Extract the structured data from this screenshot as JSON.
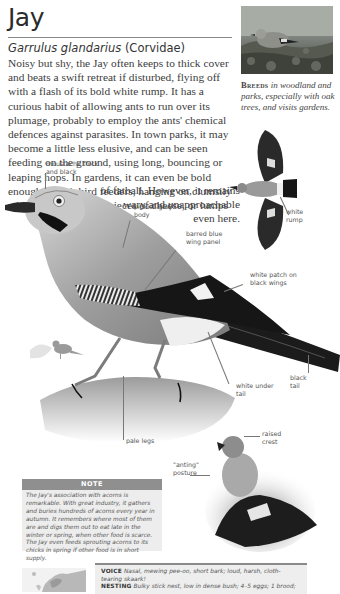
{
  "header": {
    "title": "Jay",
    "latin_name": "Garrulus glandarius",
    "family": "(Corvidae)"
  },
  "body": {
    "main_text": "Noisy but shy, the Jay often keeps to thick cover and beats a swift retreat if disturbed, flying off with a flash of its bold white rump. It has a curious habit of allowing ants to run over its plumage, probably to employ the ants' chemical defences against parasites. In town parks, it may become a little less elusive, and can be seen feeding on the ground, using long, bouncing or leaping hops. In gardens, it can even be bold enough to visit bird feeders, hanging on clumsily while taking peanuts, pieces of cheese, or lumps",
    "tail_text": "of fatball. However, it remains wary and unapproachable even here."
  },
  "photo": {
    "breeds_label": "Breeds",
    "breeds_text": "in woodland and parks, especially with oak trees, and visits gardens."
  },
  "annotations": {
    "moustache": "moustache thick and black",
    "body": "pinkish grey body",
    "wing_panel": "barred blue wing panel",
    "white_patch": "white patch on black wings",
    "white_rump": "white rump",
    "black_tail": "black tail",
    "under_tail": "white under tail",
    "legs": "pale legs",
    "crest": "raised crest",
    "anting": "\"anting\" posture"
  },
  "note": {
    "heading": "NOTE",
    "text": "The Jay's association with acorns is remarkable. With great industry, it gathers and buries hundreds of acorns every year in autumn. It remembers where most of them are and digs them out to eat late in the winter or spring, when other food is scarce. The Jay even feeds sprouting acorns to its chicks in spring if other food is in short supply."
  },
  "facts": {
    "voice_label": "VOICE",
    "voice_text": "Nasal, mewing pee-oo, short bark; loud, harsh, cloth-tearing skaark!",
    "nesting_label": "NESTING",
    "nesting_text": "Bulky stick nest, low in dense bush; 4–5 eggs; 1 brood;"
  },
  "colors": {
    "rule": "#8a8a8a",
    "note_header": "#8f8f8f",
    "note_bg": "#ededed",
    "text": "#3c3c3c"
  }
}
